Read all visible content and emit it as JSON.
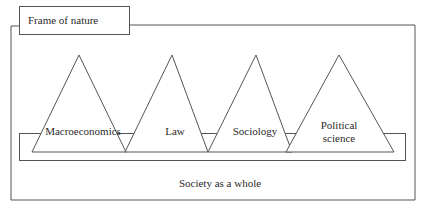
{
  "diagram": {
    "frame_title": "Frame of nature",
    "disciplines": [
      {
        "label": "Macroeconomics"
      },
      {
        "label": "Law"
      },
      {
        "label": "Sociology"
      },
      {
        "label_line1": "Political",
        "label_line2": "science"
      }
    ],
    "base_label": "Society as a whole"
  }
}
